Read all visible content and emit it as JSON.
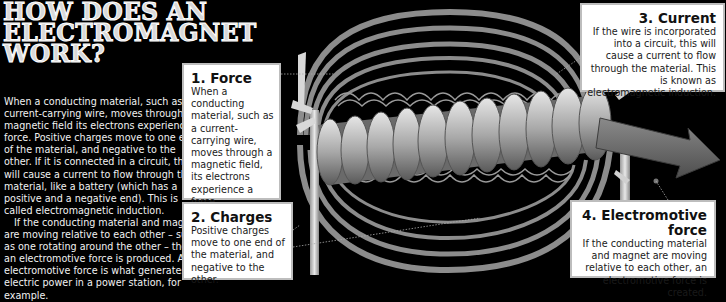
{
  "title": {
    "lines": [
      "How does an",
      "electromagnet",
      "work?"
    ]
  },
  "intro": {
    "paragraphs": [
      "When a conducting material, such as a current-carrying wire, moves through a magnetic field its electrons experience a force. Positive charges move to one end of the material, and negative to the other. If it is connected in a circuit, this will cause a current to flow through the material, like a battery (which has a positive and a negative end). This is called electromagnetic induction.",
      "If the conducting material and magnet are moving relative to each other – such as one rotating around the other – then an electromotive force is produced. An electromotive force is what generates electric power in a power station, for example."
    ]
  },
  "callouts": [
    {
      "number": "1.",
      "heading": "1. Force",
      "text": "When a conducting material, such as a current-carrying wire, moves through a magnetic field, its electrons experience a force."
    },
    {
      "number": "2.",
      "heading": "2. Charges",
      "text": "Positive charges move to one end of the material, and negative to the other."
    },
    {
      "number": "3.",
      "heading": "3. Current",
      "text": "If the wire is incorporated into a circuit, this will cause a current to flow through the material. This is known as electromagnetic induction."
    },
    {
      "number": "4.",
      "heading": "4. Electromotive force",
      "text": "If the conducting material and magnet are moving relative to each other, an electromotive force is created."
    }
  ],
  "diagram": {
    "colors": {
      "background": "#000000",
      "field_lines": "#8a8a8a",
      "coil": "#b5b5b5",
      "arrow": "#6e6e6e",
      "box_bg": "#ffffff",
      "box_border": "#bdbdbd"
    }
  }
}
